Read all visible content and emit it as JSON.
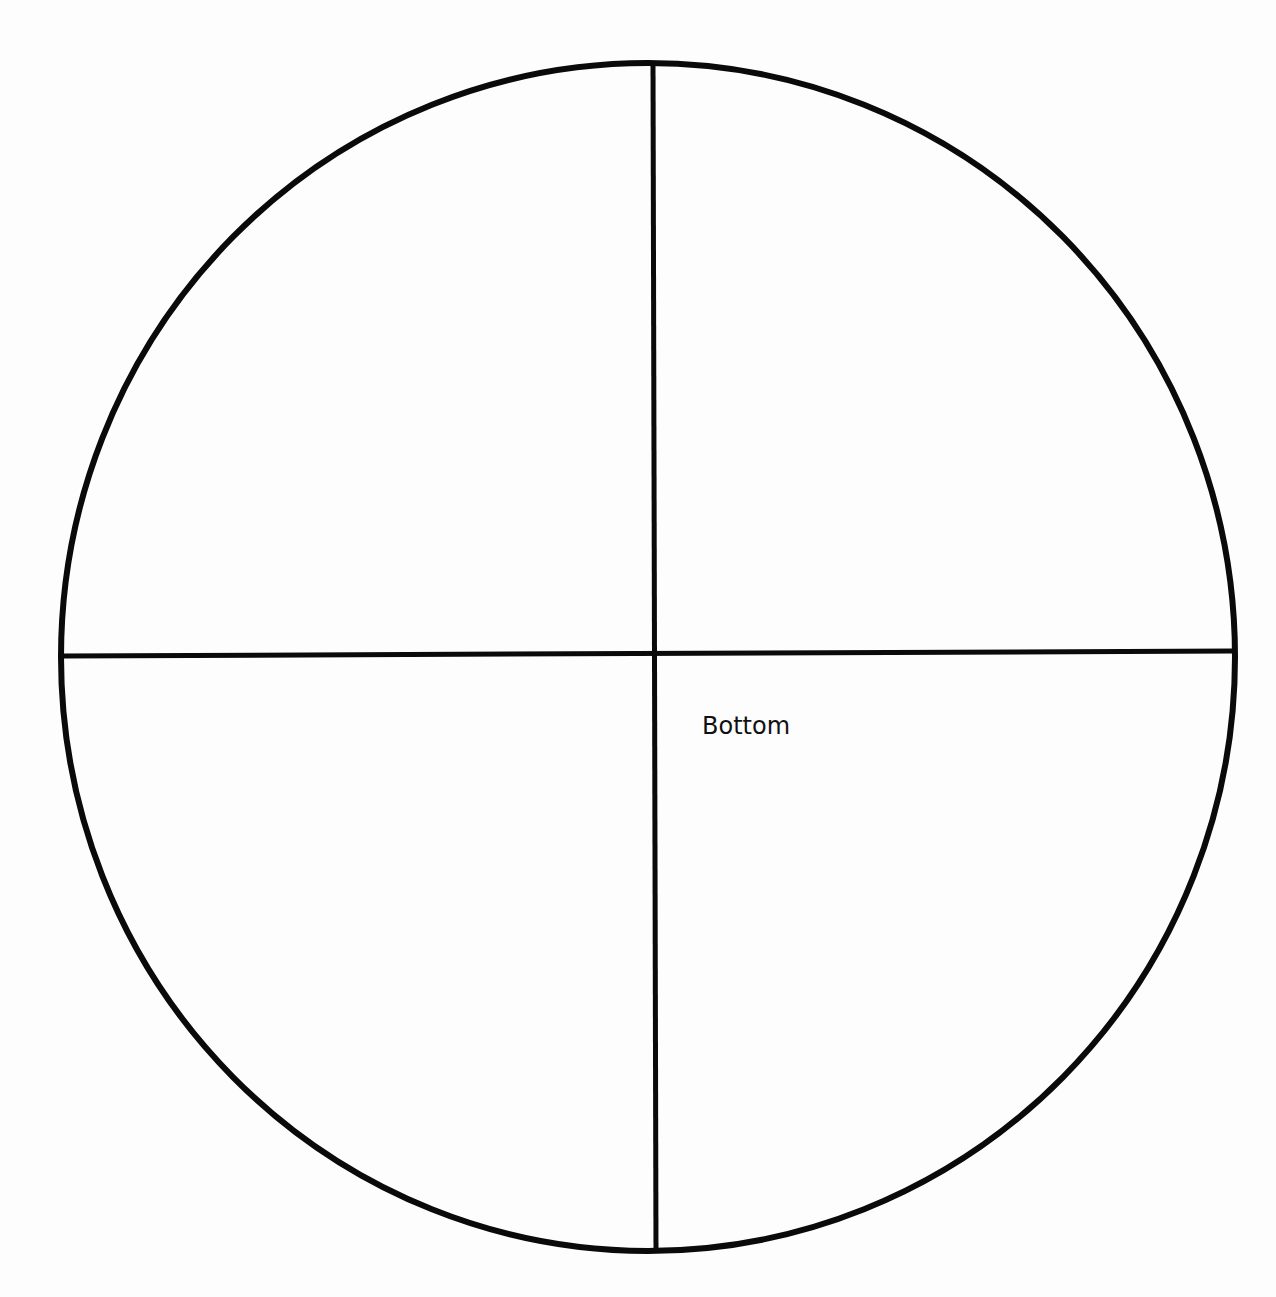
{
  "diagram": {
    "type": "quartered-circle",
    "stroke_color": "#0a0a0a",
    "background_color": "#fdfdfd",
    "circle": {
      "cx": 648,
      "cy": 657,
      "rx": 587,
      "ry": 594,
      "stroke_width": 6
    },
    "lines": [
      {
        "name": "vertical-divider",
        "x1": 653,
        "y1": 64,
        "x2": 656,
        "y2": 1252,
        "stroke_width": 5
      },
      {
        "name": "horizontal-divider",
        "x1": 63,
        "y1": 656,
        "x2": 1233,
        "y2": 651,
        "stroke_width": 5
      }
    ],
    "labels": [
      {
        "name": "bottom-label",
        "text": "Bottom",
        "x": 702,
        "y": 714
      }
    ]
  }
}
